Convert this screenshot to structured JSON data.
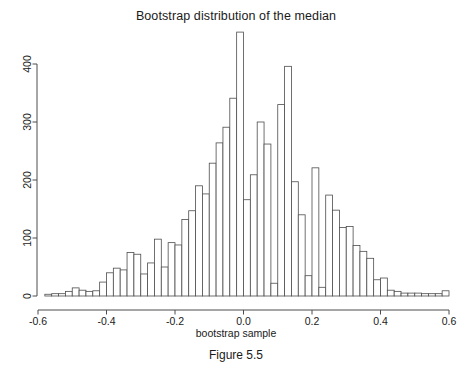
{
  "figure": {
    "title": "Bootstrap distribution of the median",
    "caption": "Figure 5.5"
  },
  "axes": {
    "xlabel": "bootstrap sample",
    "ylabel": "",
    "x_ticks": [
      "-0.6",
      "-0.4",
      "-0.2",
      "0.0",
      "0.2",
      "0.4",
      "0.6"
    ],
    "y_ticks": [
      "0",
      "100",
      "200",
      "300",
      "400"
    ]
  },
  "colors": {
    "bar_stroke": "#4d4d4d",
    "bar_fill": "#ffffff",
    "axis": "#4d4d4d",
    "text": "#1a1a1a",
    "background": "#ffffff"
  },
  "chart_data": {
    "type": "bar",
    "title": "Bootstrap distribution of the median",
    "xlabel": "bootstrap sample",
    "ylabel": "",
    "xlim": [
      -0.6,
      0.6
    ],
    "ylim": [
      0,
      460
    ],
    "xtick_values": [
      -0.6,
      -0.4,
      -0.2,
      0.0,
      0.2,
      0.4,
      0.6
    ],
    "ytick_values": [
      0,
      100,
      200,
      300,
      400
    ],
    "grid": false,
    "legend": null,
    "bin_width": 0.02,
    "bin_left_edges": [
      -0.58,
      -0.56,
      -0.54,
      -0.52,
      -0.5,
      -0.48,
      -0.46,
      -0.44,
      -0.42,
      -0.4,
      -0.38,
      -0.36,
      -0.34,
      -0.32,
      -0.3,
      -0.28,
      -0.26,
      -0.24,
      -0.22,
      -0.2,
      -0.18,
      -0.16,
      -0.14,
      -0.12,
      -0.1,
      -0.08,
      -0.06,
      -0.04,
      -0.02,
      0.0,
      0.02,
      0.04,
      0.06,
      0.08,
      0.1,
      0.12,
      0.14,
      0.16,
      0.18,
      0.2,
      0.22,
      0.24,
      0.26,
      0.28,
      0.3,
      0.32,
      0.34,
      0.36,
      0.38,
      0.4,
      0.42,
      0.44,
      0.46,
      0.48,
      0.5,
      0.52,
      0.54,
      0.56,
      0.58
    ],
    "bin_centers": [
      -0.57,
      -0.55,
      -0.53,
      -0.51,
      -0.49,
      -0.47,
      -0.45,
      -0.43,
      -0.41,
      -0.39,
      -0.37,
      -0.35,
      -0.33,
      -0.31,
      -0.29,
      -0.27,
      -0.25,
      -0.23,
      -0.21,
      -0.19,
      -0.17,
      -0.15,
      -0.13,
      -0.11,
      -0.09,
      -0.07,
      -0.05,
      -0.03,
      -0.01,
      0.01,
      0.03,
      0.05,
      0.07,
      0.09,
      0.11,
      0.13,
      0.15,
      0.17,
      0.19,
      0.21,
      0.23,
      0.25,
      0.27,
      0.29,
      0.31,
      0.33,
      0.35,
      0.37,
      0.39,
      0.41,
      0.43,
      0.45,
      0.47,
      0.49,
      0.51,
      0.53,
      0.55,
      0.57,
      0.59
    ],
    "counts": [
      3,
      4,
      4,
      8,
      14,
      10,
      8,
      9,
      24,
      40,
      48,
      45,
      75,
      72,
      38,
      57,
      98,
      50,
      92,
      88,
      132,
      147,
      190,
      176,
      229,
      264,
      291,
      341,
      455,
      166,
      209,
      300,
      262,
      22,
      330,
      396,
      197,
      140,
      35,
      221,
      15,
      174,
      148,
      118,
      120,
      87,
      77,
      65,
      28,
      31,
      10,
      8,
      5,
      5,
      5,
      4,
      4,
      4,
      9
    ],
    "note": "Histogram of bootstrap medians; unimodal, centered near 0.0, peak count ~455 at bin centered 0.01"
  }
}
